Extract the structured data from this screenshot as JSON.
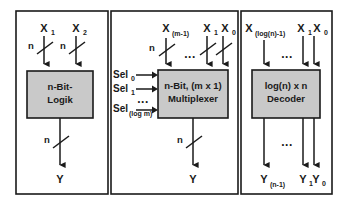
{
  "figure": {
    "background_color": "#ffffff",
    "line_color": "#1a1a1a",
    "block_fill_color": "#c9c9c9",
    "ellipsis": "..."
  },
  "panels": [
    {
      "id": "panel-logic",
      "block_label_line1": "n-Bit-",
      "block_label_line2": "Logik",
      "inputs": [
        {
          "name": "X",
          "subscript": "1",
          "bus_width": "n"
        },
        {
          "name": "X",
          "subscript": "2",
          "bus_width": "n"
        }
      ],
      "outputs": [
        {
          "name": "Y",
          "subscript": "",
          "bus_width": "n"
        }
      ],
      "select_inputs": []
    },
    {
      "id": "panel-multiplexer",
      "block_label_line1": "n-Bit, (m x 1)",
      "block_label_line2": "Multiplexer",
      "inputs": [
        {
          "name": "X",
          "subscript": "(m-1)",
          "bus_width": "n"
        },
        {
          "name": "X",
          "subscript": "1",
          "bus_width": ""
        },
        {
          "name": "X",
          "subscript": "0",
          "bus_width": ""
        }
      ],
      "outputs": [
        {
          "name": "Y",
          "subscript": "",
          "bus_width": "n"
        }
      ],
      "select_inputs": [
        {
          "name": "Sel",
          "subscript": "0"
        },
        {
          "name": "Sel",
          "subscript": "1"
        },
        {
          "name": "Sel",
          "subscript": "(log m)"
        }
      ]
    },
    {
      "id": "panel-decoder",
      "block_label_line1": "log(n) x n",
      "block_label_line2": "Decoder",
      "inputs": [
        {
          "name": "X",
          "subscript": "(log(n)-1)",
          "bus_width": ""
        },
        {
          "name": "X",
          "subscript": "1",
          "bus_width": ""
        },
        {
          "name": "X",
          "subscript": "0",
          "bus_width": ""
        }
      ],
      "outputs": [
        {
          "name": "Y",
          "subscript": "(n-1)",
          "bus_width": ""
        },
        {
          "name": "Y",
          "subscript": "1",
          "bus_width": ""
        },
        {
          "name": "Y",
          "subscript": "0",
          "bus_width": ""
        }
      ],
      "select_inputs": []
    }
  ]
}
